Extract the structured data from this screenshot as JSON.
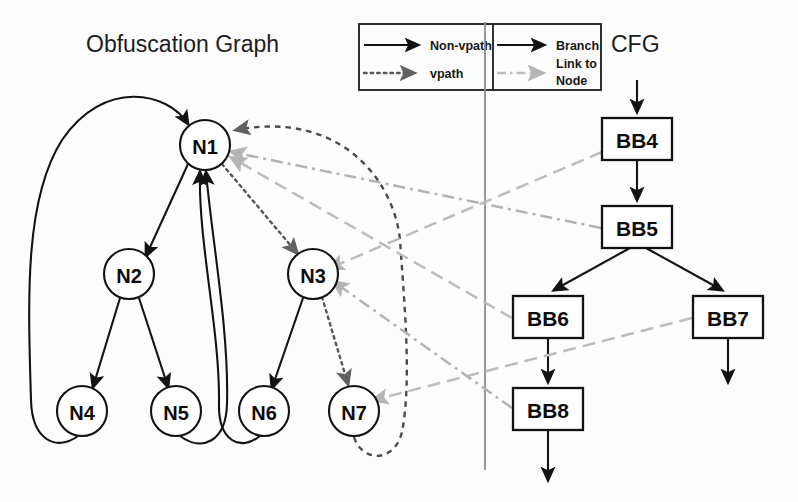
{
  "canvas": {
    "width": 798,
    "height": 502,
    "background": "#fdfdfd"
  },
  "titles": {
    "left_title": "Obfuscation Graph",
    "right_title": "CFG"
  },
  "legend": {
    "entries": [
      {
        "label": "Non-vpath",
        "style": "solid-black-arrow",
        "color": "#131313"
      },
      {
        "label": "vpath",
        "style": "dotted-gray-arrow",
        "color": "#555555"
      },
      {
        "label": "Branch",
        "style": "solid-black-arrow",
        "color": "#131313"
      },
      {
        "label": "Link to Node",
        "label_line_1": "Link to",
        "label_line_2": "Node",
        "style": "dashdot-lightgray-arrow",
        "color": "#b3b3b3"
      }
    ]
  },
  "colors": {
    "node_stroke": "#121212",
    "node_fill": "#ffffff",
    "solid_edge": "#131313",
    "vpath_edge": "#555555",
    "link_edge": "#b3b3b3",
    "divider": "#8d8d8d",
    "text": "#0c0c0c"
  },
  "obfuscation_graph": {
    "nodes": [
      {
        "id": "N1",
        "label": "N1",
        "cx": 205,
        "cy": 145,
        "r": 25
      },
      {
        "id": "N2",
        "label": "N2",
        "cx": 129,
        "cy": 274,
        "r": 25
      },
      {
        "id": "N3",
        "label": "N3",
        "cx": 313,
        "cy": 274,
        "r": 25
      },
      {
        "id": "N4",
        "label": "N4",
        "cx": 82,
        "cy": 411,
        "r": 25
      },
      {
        "id": "N5",
        "label": "N5",
        "cx": 176,
        "cy": 411,
        "r": 25
      },
      {
        "id": "N6",
        "label": "N6",
        "cx": 264,
        "cy": 411,
        "r": 25
      },
      {
        "id": "N7",
        "label": "N7",
        "cx": 354,
        "cy": 411,
        "r": 25
      }
    ],
    "edges": [
      {
        "from": "N1",
        "to": "N2",
        "type": "non-vpath"
      },
      {
        "from": "N1",
        "to": "N3",
        "type": "vpath"
      },
      {
        "from": "N2",
        "to": "N4",
        "type": "non-vpath"
      },
      {
        "from": "N2",
        "to": "N5",
        "type": "non-vpath"
      },
      {
        "from": "N3",
        "to": "N6",
        "type": "non-vpath"
      },
      {
        "from": "N3",
        "to": "N7",
        "type": "vpath"
      },
      {
        "from": "N4",
        "to": "N1",
        "type": "non-vpath"
      },
      {
        "from": "N5",
        "to": "N1",
        "type": "non-vpath"
      },
      {
        "from": "N6",
        "to": "N1",
        "type": "non-vpath"
      },
      {
        "from": "N7",
        "to": "N1",
        "type": "vpath"
      }
    ]
  },
  "cfg": {
    "blocks": [
      {
        "id": "BB4",
        "label": "BB4",
        "x": 602,
        "y": 118,
        "w": 70,
        "h": 42
      },
      {
        "id": "BB5",
        "label": "BB5",
        "x": 602,
        "y": 206,
        "w": 70,
        "h": 42
      },
      {
        "id": "BB6",
        "label": "BB6",
        "x": 513,
        "y": 296,
        "w": 70,
        "h": 42
      },
      {
        "id": "BB7",
        "label": "BB7",
        "x": 693,
        "y": 296,
        "w": 70,
        "h": 42
      },
      {
        "id": "BB8",
        "label": "BB8",
        "x": 513,
        "y": 388,
        "w": 70,
        "h": 42
      }
    ],
    "edges": [
      {
        "from": "entry",
        "to": "BB4",
        "type": "branch"
      },
      {
        "from": "BB4",
        "to": "BB5",
        "type": "branch"
      },
      {
        "from": "BB5",
        "to": "BB6",
        "type": "branch"
      },
      {
        "from": "BB5",
        "to": "BB7",
        "type": "branch"
      },
      {
        "from": "BB6",
        "to": "BB8",
        "type": "branch"
      },
      {
        "from": "BB7",
        "to": "exit",
        "type": "branch"
      },
      {
        "from": "BB8",
        "to": "exit",
        "type": "branch"
      }
    ]
  },
  "cross_links": [
    {
      "from": "BB4",
      "to": "N3",
      "type": "link-to-node"
    },
    {
      "from": "BB5",
      "to": "N1",
      "type": "link-to-node"
    },
    {
      "from": "BB6",
      "to": "N1",
      "type": "link-to-node"
    },
    {
      "from": "BB7",
      "to": "N7",
      "type": "link-to-node"
    },
    {
      "from": "BB8",
      "to": "N3",
      "type": "link-to-node"
    }
  ]
}
